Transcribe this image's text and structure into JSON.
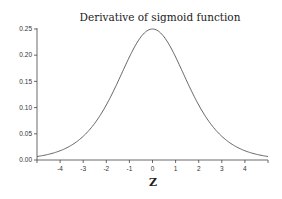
{
  "chart_data": {
    "type": "line",
    "title": "Derivative of sigmoid function",
    "xlabel": "Z",
    "ylabel": "",
    "xlim": [
      -5,
      5
    ],
    "ylim": [
      0,
      0.25
    ],
    "x_ticks": [
      "-4",
      "-3",
      "-2",
      "-1",
      "0",
      "1",
      "2",
      "3",
      "4"
    ],
    "y_ticks": [
      "0.00",
      "0.05",
      "0.10",
      "0.15",
      "0.20",
      "0.25"
    ],
    "grid": false,
    "legend": null,
    "series": [
      {
        "name": "sigmoid'(z)",
        "x": [
          -5,
          -4,
          -3,
          -2,
          -1,
          0,
          1,
          2,
          3,
          4,
          5
        ],
        "values": [
          0.0066,
          0.0177,
          0.0452,
          0.105,
          0.1966,
          0.25,
          0.1966,
          0.105,
          0.0452,
          0.0177,
          0.0066
        ]
      }
    ],
    "line_color": "#555555"
  }
}
